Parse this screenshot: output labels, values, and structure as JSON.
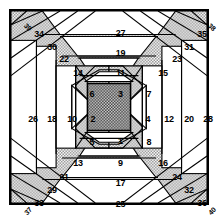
{
  "figure": {
    "type": "pineapple-quilt-block-piecing-diagram",
    "shape": "square",
    "center_piece": {
      "name": "center-square",
      "fill": "dark-dotted"
    },
    "colors": {
      "line": "#000000",
      "plain_fabric": "#ffffff",
      "stipple_fabric": "#c9c9c9",
      "center_fabric": "#555555",
      "background": "#ffffff"
    }
  },
  "pieces": [
    {
      "n": "1",
      "x": 109.5,
      "y": 130.0,
      "role": "bottom",
      "fabric": "plain"
    },
    {
      "n": "2",
      "x": 82.0,
      "y": 107.5,
      "role": "left",
      "fabric": "plain"
    },
    {
      "n": "3",
      "x": 109.5,
      "y": 83.0,
      "role": "top",
      "fabric": "plain"
    },
    {
      "n": "4",
      "x": 137.0,
      "y": 107.5,
      "role": "right",
      "fabric": "plain"
    },
    {
      "n": "5",
      "x": 81.0,
      "y": 131.0,
      "role": "corner-sw",
      "fabric": "stipple"
    },
    {
      "n": "6",
      "x": 81.0,
      "y": 83.0,
      "role": "corner-nw",
      "fabric": "stipple"
    },
    {
      "n": "7",
      "x": 138.0,
      "y": 83.0,
      "role": "corner-ne",
      "fabric": "stipple"
    },
    {
      "n": "8",
      "x": 138.0,
      "y": 131.0,
      "role": "corner-se",
      "fabric": "stipple"
    },
    {
      "n": "9",
      "x": 109.5,
      "y": 152.0,
      "role": "bottom",
      "fabric": "plain"
    },
    {
      "n": "10",
      "x": 61.0,
      "y": 107.5,
      "role": "left",
      "fabric": "plain"
    },
    {
      "n": "11",
      "x": 109.5,
      "y": 62.0,
      "role": "top",
      "fabric": "plain"
    },
    {
      "n": "12",
      "x": 158.0,
      "y": 107.5,
      "role": "right",
      "fabric": "plain"
    },
    {
      "n": "13",
      "x": 67.0,
      "y": 152.0,
      "role": "corner-sw",
      "fabric": "stipple"
    },
    {
      "n": "14",
      "x": 67.0,
      "y": 62.0,
      "role": "corner-nw",
      "fabric": "stipple"
    },
    {
      "n": "15",
      "x": 152.0,
      "y": 62.0,
      "role": "corner-ne",
      "fabric": "stipple"
    },
    {
      "n": "16",
      "x": 152.0,
      "y": 152.0,
      "role": "corner-se",
      "fabric": "stipple"
    },
    {
      "n": "17",
      "x": 109.5,
      "y": 172.0,
      "role": "bottom",
      "fabric": "plain"
    },
    {
      "n": "18",
      "x": 41.0,
      "y": 107.5,
      "role": "left",
      "fabric": "plain"
    },
    {
      "n": "19",
      "x": 109.5,
      "y": 42.0,
      "role": "top",
      "fabric": "plain"
    },
    {
      "n": "20",
      "x": 178.0,
      "y": 107.5,
      "role": "right",
      "fabric": "plain"
    },
    {
      "n": "21",
      "x": 53.0,
      "y": 166.0,
      "role": "corner-sw",
      "fabric": "stipple"
    },
    {
      "n": "22",
      "x": 53.0,
      "y": 48.0,
      "role": "corner-nw",
      "fabric": "stipple"
    },
    {
      "n": "23",
      "x": 166.0,
      "y": 48.0,
      "role": "corner-ne",
      "fabric": "stipple"
    },
    {
      "n": "24",
      "x": 166.0,
      "y": 166.0,
      "role": "corner-se",
      "fabric": "stipple"
    },
    {
      "n": "25",
      "x": 109.5,
      "y": 193.0,
      "role": "bottom",
      "fabric": "plain"
    },
    {
      "n": "26",
      "x": 22.0,
      "y": 107.5,
      "role": "left",
      "fabric": "plain"
    },
    {
      "n": "27",
      "x": 109.5,
      "y": 22.0,
      "role": "top",
      "fabric": "plain"
    },
    {
      "n": "28",
      "x": 197.0,
      "y": 107.5,
      "role": "right",
      "fabric": "plain"
    },
    {
      "n": "29",
      "x": 41.0,
      "y": 179.0,
      "role": "corner-sw",
      "fabric": "stipple"
    },
    {
      "n": "30",
      "x": 41.0,
      "y": 36.0,
      "role": "corner-nw",
      "fabric": "stipple"
    },
    {
      "n": "31",
      "x": 178.0,
      "y": 36.0,
      "role": "corner-ne",
      "fabric": "stipple"
    },
    {
      "n": "32",
      "x": 178.0,
      "y": 179.0,
      "role": "corner-se",
      "fabric": "stipple"
    },
    {
      "n": "33",
      "x": 28.0,
      "y": 192.0,
      "role": "corner-sw",
      "fabric": "stipple"
    },
    {
      "n": "34",
      "x": 28.0,
      "y": 23.0,
      "role": "corner-nw",
      "fabric": "stipple"
    },
    {
      "n": "35",
      "x": 191.0,
      "y": 23.0,
      "role": "corner-ne",
      "fabric": "stipple"
    },
    {
      "n": "36",
      "x": 191.0,
      "y": 192.0,
      "role": "corner-se",
      "fabric": "stipple"
    }
  ],
  "corner_pieces": [
    {
      "n": "37",
      "x": 17.0,
      "y": 200.0,
      "role": "tip-sw",
      "rotated": "-45deg",
      "cls": "r37"
    },
    {
      "n": "38",
      "x": 201.0,
      "y": 16.0,
      "role": "tip-ne",
      "rotated": "45deg",
      "cls": "r38"
    },
    {
      "n": "39",
      "x": 17.0,
      "y": 16.0,
      "role": "tip-nw",
      "rotated": "45deg",
      "cls": "r39"
    },
    {
      "n": "40",
      "x": 201.0,
      "y": 200.0,
      "role": "tip-se",
      "rotated": "-45deg",
      "cls": "r40"
    }
  ]
}
